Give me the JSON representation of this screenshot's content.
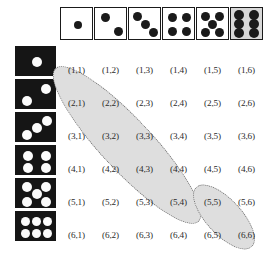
{
  "figure": {
    "type": "sample-space-grid",
    "rows": 6,
    "columns": 6,
    "background_color": "#ffffff"
  },
  "column_headers": {
    "description": "White dice with black pips, values 1 through 6, left to right",
    "dice": [
      {
        "value": 1,
        "face_color": "#ffffff",
        "pip_color": "#1a1a1a",
        "shaded": false
      },
      {
        "value": 2,
        "face_color": "#ffffff",
        "pip_color": "#1a1a1a",
        "shaded": false
      },
      {
        "value": 3,
        "face_color": "#ffffff",
        "pip_color": "#1a1a1a",
        "shaded": false
      },
      {
        "value": 4,
        "face_color": "#ffffff",
        "pip_color": "#1a1a1a",
        "shaded": false
      },
      {
        "value": 5,
        "face_color": "#ffffff",
        "pip_color": "#1a1a1a",
        "shaded": false
      },
      {
        "value": 6,
        "face_color": "#d8d8d8",
        "pip_color": "#1a1a1a",
        "shaded": true
      }
    ]
  },
  "row_headers": {
    "description": "Black dice with white pips, values 1 through 6, top to bottom",
    "dice": [
      {
        "value": 1,
        "face_color": "#151515",
        "pip_color": "#fbfbfb"
      },
      {
        "value": 2,
        "face_color": "#151515",
        "pip_color": "#fbfbfb"
      },
      {
        "value": 3,
        "face_color": "#151515",
        "pip_color": "#fbfbfb"
      },
      {
        "value": 4,
        "face_color": "#151515",
        "pip_color": "#fbfbfb"
      },
      {
        "value": 5,
        "face_color": "#151515",
        "pip_color": "#fbfbfb"
      },
      {
        "value": 6,
        "face_color": "#151515",
        "pip_color": "#fbfbfb"
      }
    ]
  },
  "grid": {
    "labels": [
      [
        "(1,1)",
        "(1,2)",
        "(1,3)",
        "(1,4)",
        "(1,5)",
        "(1,6)"
      ],
      [
        "(2,1)",
        "(2,2)",
        "(2,3)",
        "(2,4)",
        "(2,5)",
        "(2,6)"
      ],
      [
        "(3,1)",
        "(3,2)",
        "(3,3)",
        "(3,4)",
        "(3,5)",
        "(3,6)"
      ],
      [
        "(4,1)",
        "(4,2)",
        "(4,3)",
        "(4,4)",
        "(4,5)",
        "(4,6)"
      ],
      [
        "(5,1)",
        "(5,2)",
        "(5,3)",
        "(5,4)",
        "(5,5)",
        "(5,6)"
      ],
      [
        "(6,1)",
        "(6,2)",
        "(6,3)",
        "(6,4)",
        "(6,5)",
        "(6,6)"
      ]
    ]
  },
  "highlights": [
    {
      "name": "sum-seven-diagonal",
      "cells": [
        "(1,6)",
        "(2,5)",
        "(3,4)",
        "(4,3)",
        "(5,2)",
        "(6,1)"
      ],
      "fill_color": "#dedede",
      "border_color": "#6f6f6f",
      "border_style": "dotted"
    },
    {
      "name": "sum-eleven-diagonal",
      "cells": [
        "(5,6)",
        "(6,5)"
      ],
      "fill_color": "#dedede",
      "border_color": "#6f6f6f",
      "border_style": "dotted"
    }
  ]
}
